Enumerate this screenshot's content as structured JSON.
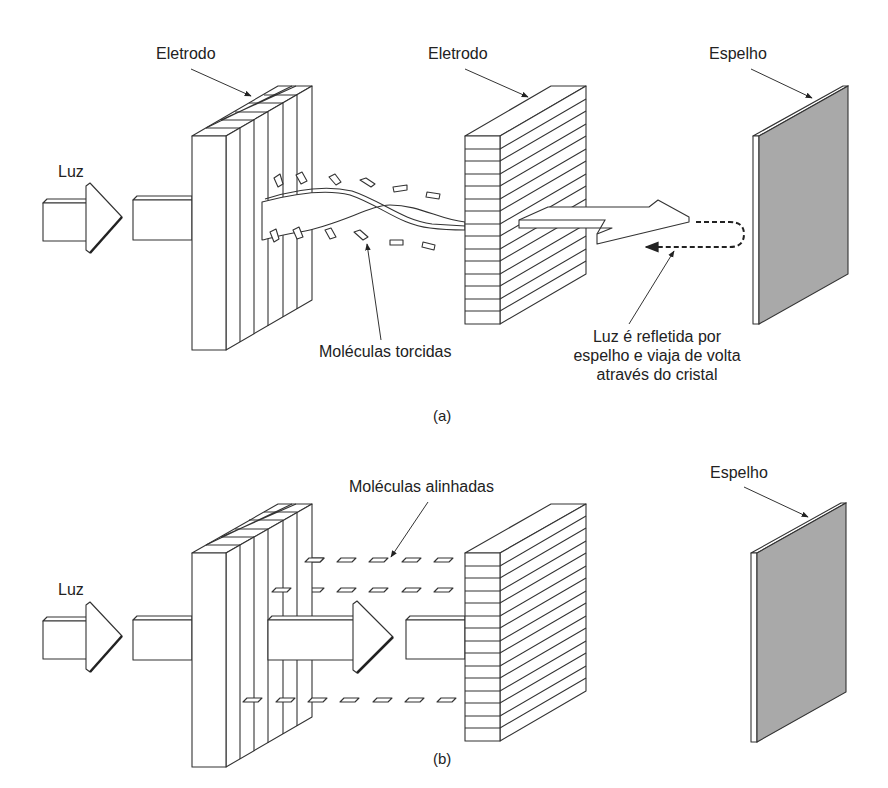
{
  "figure_a": {
    "labels": {
      "light": "Luz",
      "electrode_left": "Eletrodo",
      "electrode_right": "Eletrodo",
      "mirror": "Espelho",
      "twisted_molecules": "Moléculas torcidas",
      "reflected_line1": "Luz é refletida por",
      "reflected_line2": "espelho e viaja de volta",
      "reflected_line3": "através do cristal"
    },
    "caption": "(a)"
  },
  "figure_b": {
    "labels": {
      "light": "Luz",
      "mirror": "Espelho",
      "aligned_molecules": "Moléculas alinhadas"
    },
    "caption": "(b)"
  },
  "colors": {
    "line": "#333333",
    "mirror_face": "#a9a9a9",
    "background": "#ffffff"
  }
}
